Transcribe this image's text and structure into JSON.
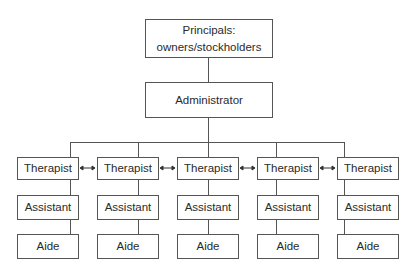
{
  "diagram": {
    "type": "org-chart",
    "top": {
      "line1": "Principals:",
      "line2": "owners/stockholders"
    },
    "admin": {
      "label": "Administrator"
    },
    "columns": [
      {
        "therapist": "Therapist",
        "assistant": "Assistant",
        "aide": "Aide"
      },
      {
        "therapist": "Therapist",
        "assistant": "Assistant",
        "aide": "Aide"
      },
      {
        "therapist": "Therapist",
        "assistant": "Assistant",
        "aide": "Aide"
      },
      {
        "therapist": "Therapist",
        "assistant": "Assistant",
        "aide": "Aide"
      },
      {
        "therapist": "Therapist",
        "assistant": "Assistant",
        "aide": "Aide"
      }
    ],
    "peer_connector_icon": "double-arrow",
    "colors": {
      "line": "#555555",
      "text": "#2a2a2a",
      "background": "#ffffff"
    }
  }
}
